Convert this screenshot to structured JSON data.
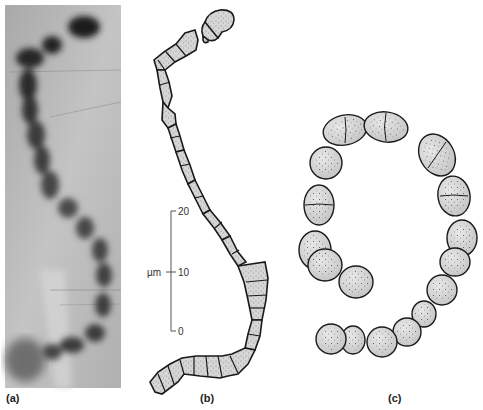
{
  "figure": {
    "panels": [
      {
        "id": "a",
        "label": "(a)",
        "kind": "micrograph",
        "description": "Photomicrograph of a filamentous chain of cells"
      },
      {
        "id": "b",
        "label": "(b)",
        "kind": "drawing",
        "description": "Line drawing of segmented filament with stippled cells"
      },
      {
        "id": "c",
        "label": "(c)",
        "kind": "drawing",
        "description": "Coiled chain of round stippled cells"
      }
    ],
    "scale_bar": {
      "unit": "µm",
      "ticks": [
        "20",
        "10",
        "0"
      ]
    },
    "colors": {
      "cell_fill": "#d6d6d6",
      "cell_stroke": "#1a1a1a",
      "stipple": "#444444",
      "photo_bg": "#b8b8b8",
      "photo_dark": "#2a2a2a"
    }
  }
}
